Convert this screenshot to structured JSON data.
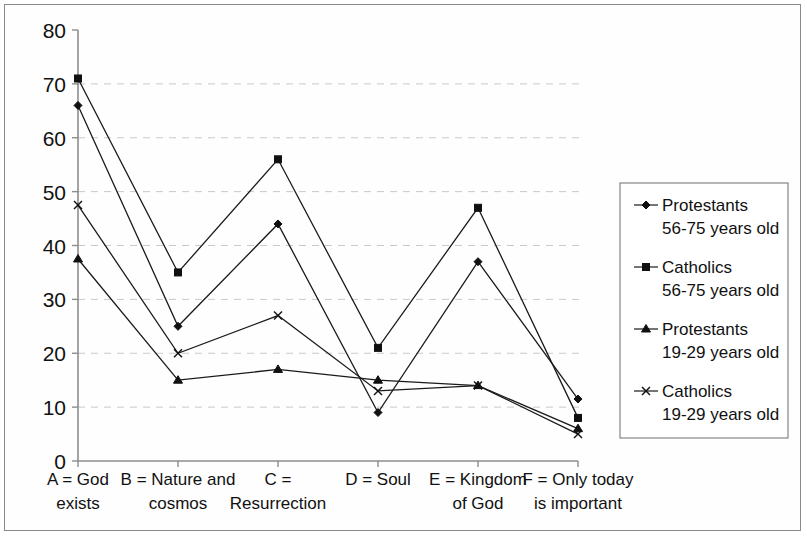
{
  "chart_data": {
    "type": "line",
    "title": "",
    "xlabel": "",
    "ylabel": "",
    "ylim": [
      0,
      80
    ],
    "ytick_step": 10,
    "yticks": [
      "0",
      "10",
      "20",
      "30",
      "40",
      "50",
      "60",
      "70",
      "80"
    ],
    "grid": true,
    "legend_position": "right",
    "categories": [
      "A",
      "B",
      "C",
      "D",
      "E",
      "F"
    ],
    "category_labels": [
      {
        "line1": "A = God",
        "line2": "exists"
      },
      {
        "line1": "B = Nature and",
        "line2": "cosmos"
      },
      {
        "line1": "C =",
        "line2": "Resurrection"
      },
      {
        "line1": "D = Soul",
        "line2": ""
      },
      {
        "line1": "E = Kingdom",
        "line2": "of God"
      },
      {
        "line1": "F = Only today",
        "line2": "is important"
      }
    ],
    "series": [
      {
        "name": "Protestants 56-75 years old",
        "legend_line1": "Protestants",
        "legend_line2": "56-75 years old",
        "marker": "diamond",
        "color": "#101010",
        "values": [
          66,
          25,
          44,
          9,
          37,
          11.5
        ]
      },
      {
        "name": "Catholics 56-75 years old",
        "legend_line1": "Catholics",
        "legend_line2": "56-75 years old",
        "marker": "square",
        "color": "#101010",
        "values": [
          71,
          35,
          56,
          21,
          47,
          8
        ]
      },
      {
        "name": "Protestants 19-29 years old",
        "legend_line1": "Protestants",
        "legend_line2": "19-29 years old",
        "marker": "triangle",
        "color": "#101010",
        "values": [
          37.5,
          15,
          17,
          15,
          14,
          6
        ]
      },
      {
        "name": "Catholics 19-29 years old",
        "legend_line1": "Catholics",
        "legend_line2": "19-29 years old",
        "marker": "cross",
        "color": "#101010",
        "values": [
          47.5,
          20,
          27,
          13,
          14,
          5
        ]
      }
    ]
  },
  "colors": {
    "background": "#ffffff",
    "frame_border": "#8a8a8a",
    "grid": "#c9c9c9",
    "axis": "#8d8d8d",
    "ink": "#101010"
  }
}
